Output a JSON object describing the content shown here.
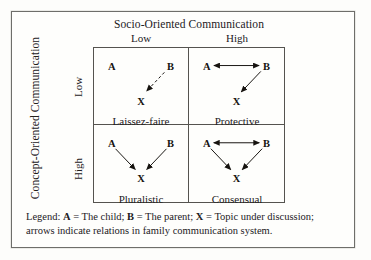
{
  "figure": {
    "top_axis": {
      "title": "Socio-Oriented Communication",
      "levels": [
        "Low",
        "High"
      ]
    },
    "left_axis": {
      "title": "Concept-Oriented Communication",
      "levels": [
        "Low",
        "High"
      ]
    },
    "nodes": {
      "a": "A",
      "b": "B",
      "x": "X"
    },
    "quadrants": [
      {
        "id": "laissez-faire",
        "label": "Laissez-faire",
        "socio": "Low",
        "concept": "Low",
        "arrows": [
          "B-to-X dashed"
        ]
      },
      {
        "id": "protective",
        "label": "Protective",
        "socio": "High",
        "concept": "Low",
        "arrows": [
          "A-to-B bidirectional",
          "B-to-X"
        ]
      },
      {
        "id": "pluralistic",
        "label": "Pluralistic",
        "socio": "Low",
        "concept": "High",
        "arrows": [
          "A-to-X",
          "B-to-X"
        ]
      },
      {
        "id": "consensual",
        "label": "Consensual",
        "socio": "High",
        "concept": "High",
        "arrows": [
          "A-to-B bidirectional",
          "A-to-X",
          "B-to-X"
        ]
      }
    ],
    "legend": {
      "line1_prefix": "Legend:",
      "item_a_key": "A",
      "item_a_text": "= The child;",
      "item_b_key": "B",
      "item_b_text": "= The parent;",
      "item_x_key": "X",
      "item_x_text": "= Topic under discussion;",
      "line2": "arrows indicate relations in family communication system."
    }
  },
  "colors": {
    "ink": "#23201c",
    "rule": "#55534f",
    "frame": "#6e6e6a",
    "paper": "#fdfdfb"
  }
}
